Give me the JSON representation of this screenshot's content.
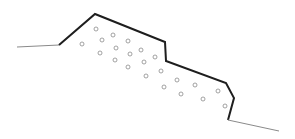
{
  "diagram": {
    "type": "slope-cross-section",
    "colors": {
      "background": "#ffffff",
      "profile_line": "#1e1e1e",
      "ground_line": "#8a8a8a",
      "circle_stroke": "#8c8c8c"
    },
    "ground_left": [
      [
        17,
        47
      ],
      [
        59,
        45
      ]
    ],
    "profile": [
      [
        59,
        45
      ],
      [
        95,
        14
      ],
      [
        165,
        42
      ],
      [
        166,
        61
      ],
      [
        226,
        83
      ],
      [
        234,
        98
      ],
      [
        228,
        120
      ]
    ],
    "ground_right": [
      [
        228,
        120
      ],
      [
        279,
        131
      ]
    ],
    "circles": [
      [
        96,
        29
      ],
      [
        113,
        35
      ],
      [
        102,
        40
      ],
      [
        82,
        44
      ],
      [
        128,
        41
      ],
      [
        116,
        48
      ],
      [
        141,
        50
      ],
      [
        100,
        53
      ],
      [
        130,
        54
      ],
      [
        115,
        60
      ],
      [
        144,
        62
      ],
      [
        128,
        67
      ],
      [
        146,
        76
      ],
      [
        155,
        57
      ],
      [
        161,
        71
      ],
      [
        177,
        80
      ],
      [
        164,
        87
      ],
      [
        195,
        85
      ],
      [
        181,
        94
      ],
      [
        218,
        91
      ],
      [
        203,
        99
      ],
      [
        225,
        106
      ]
    ],
    "circle_radius": 2
  }
}
